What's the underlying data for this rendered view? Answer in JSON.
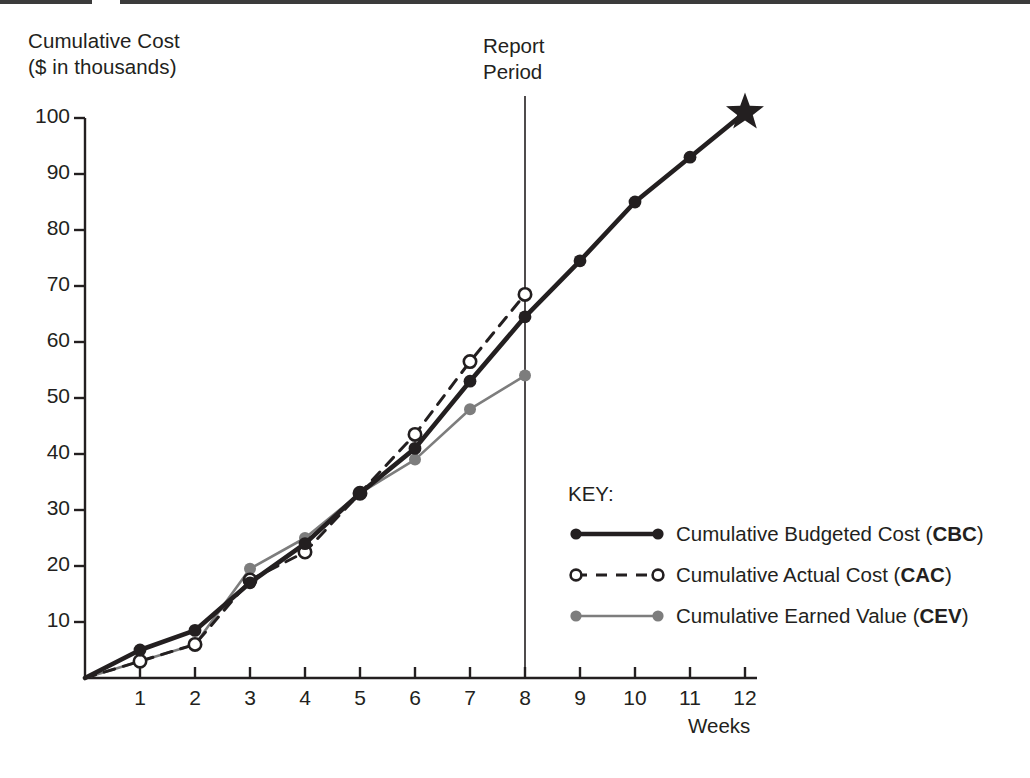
{
  "page": {
    "background": "#ffffff",
    "ink": "#231f20"
  },
  "axis_title": {
    "line1": "Cumulative Cost",
    "line2": "($ in thousands)",
    "text": "Cumulative Cost\n($ in thousands)"
  },
  "report_marker": {
    "line1": "Report",
    "line2": "Period",
    "text": "Report\nPeriod",
    "week": 8
  },
  "xaxis_name": "Weeks",
  "key": {
    "title": "KEY:",
    "items": [
      {
        "label_plain": "Cumulative Budgeted Cost (CBC)",
        "label_main": "Cumulative Budgeted Cost (",
        "abbr": "CBC",
        "label_tail": ")",
        "style": "solid",
        "color": "#231f20",
        "marker": "filled"
      },
      {
        "label_plain": "Cumulative Actual Cost (CAC)",
        "label_main": "Cumulative Actual Cost (",
        "abbr": "CAC",
        "label_tail": ")",
        "style": "dashed",
        "color": "#231f20",
        "marker": "open"
      },
      {
        "label_plain": "Cumulative Earned Value (CEV)",
        "label_main": "Cumulative Earned Value (",
        "abbr": "CEV",
        "label_tail": ")",
        "style": "solid",
        "color": "#7d7d7d",
        "marker": "filled-gray"
      }
    ]
  },
  "chart_data": {
    "type": "line",
    "title": "Cumulative Cost ($ in thousands)",
    "xlabel": "Weeks",
    "ylabel": "Cumulative Cost ($ in thousands)",
    "xlim": [
      0,
      12
    ],
    "ylim": [
      0,
      100
    ],
    "grid": false,
    "legend_position": "inside-bottom-right",
    "x": [
      0,
      1,
      2,
      3,
      4,
      5,
      6,
      7,
      8,
      9,
      10,
      11,
      12
    ],
    "xticks": [
      "1",
      "2",
      "3",
      "4",
      "5",
      "6",
      "7",
      "8",
      "9",
      "10",
      "11",
      "12"
    ],
    "yticks": [
      "10",
      "20",
      "30",
      "40",
      "50",
      "60",
      "70",
      "80",
      "90",
      "100"
    ],
    "annotations": [
      {
        "text": "Report Period",
        "type": "vertical-line",
        "x": 8
      },
      {
        "text": "star",
        "type": "endpoint-marker",
        "x": 12,
        "y": 101
      }
    ],
    "series": [
      {
        "name": "Cumulative Budgeted Cost (CBC)",
        "abbr": "CBC",
        "color": "#231f20",
        "style": "solid",
        "marker": "filled-circle",
        "x": [
          0,
          1,
          2,
          3,
          4,
          5,
          6,
          7,
          8,
          9,
          10,
          11,
          12
        ],
        "values": [
          0,
          5,
          8.5,
          17,
          24,
          33,
          41,
          53,
          64.5,
          74.5,
          85,
          93,
          101
        ]
      },
      {
        "name": "Cumulative Actual Cost (CAC)",
        "abbr": "CAC",
        "color": "#231f20",
        "style": "dashed",
        "marker": "open-circle",
        "x": [
          0,
          1,
          2,
          3,
          4,
          5,
          6,
          7,
          8
        ],
        "values": [
          0,
          3,
          6,
          17.5,
          22.5,
          33,
          43.5,
          56.5,
          68.5
        ]
      },
      {
        "name": "Cumulative Earned Value (CEV)",
        "abbr": "CEV",
        "color": "#7d7d7d",
        "style": "solid",
        "marker": "filled-circle",
        "x": [
          0,
          1,
          2,
          3,
          4,
          5,
          6,
          7,
          8
        ],
        "values": [
          0,
          3,
          6,
          19.5,
          25,
          33,
          39,
          48,
          54
        ]
      }
    ]
  }
}
